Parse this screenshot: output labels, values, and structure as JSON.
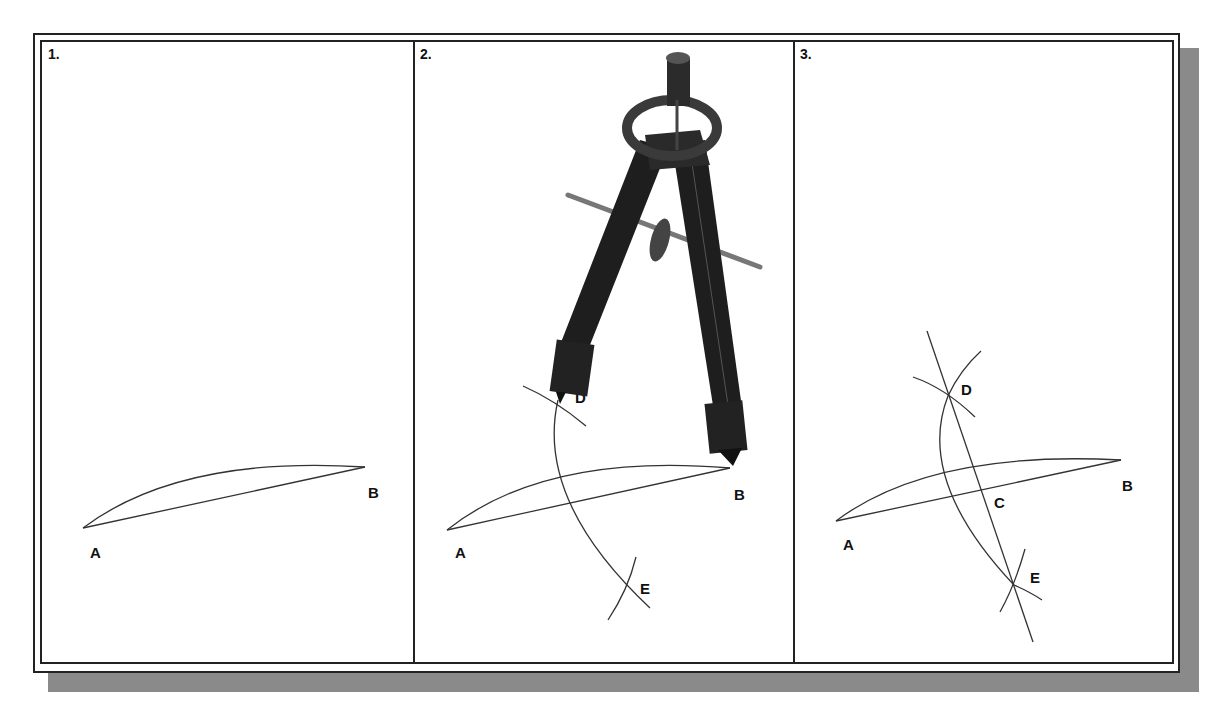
{
  "figure": {
    "panels": [
      {
        "step": "1.",
        "labels": {
          "A": "A",
          "B": "B"
        }
      },
      {
        "step": "2.",
        "labels": {
          "A": "A",
          "B": "B",
          "D": "D",
          "E": "E"
        },
        "tool": "compass"
      },
      {
        "step": "3.",
        "labels": {
          "A": "A",
          "B": "B",
          "C": "C",
          "D": "D",
          "E": "E"
        }
      }
    ]
  },
  "colors": {
    "line": "#333333",
    "frame": "#222222",
    "shadow": "#8a8a8a",
    "compass": "#1e1e1e"
  }
}
